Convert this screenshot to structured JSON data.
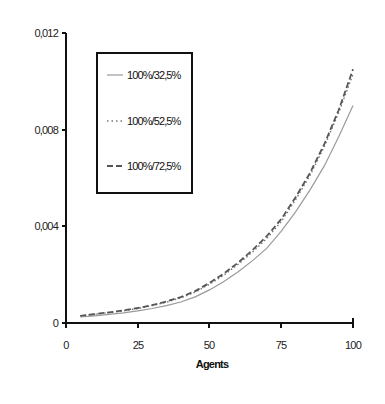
{
  "chart_data": {
    "type": "line",
    "title": "",
    "xlabel": "Agents",
    "ylabel": "",
    "xlim": [
      0,
      100
    ],
    "ylim": [
      0,
      0.012
    ],
    "x_ticks": [
      "0",
      "25",
      "50",
      "75",
      "100"
    ],
    "y_ticks": [
      "0",
      "0,004",
      "0,008",
      "0,012"
    ],
    "grid": false,
    "legend_position": "upper-left-inside",
    "x": [
      5,
      10,
      15,
      20,
      25,
      30,
      35,
      40,
      45,
      50,
      55,
      60,
      65,
      70,
      75,
      80,
      85,
      90,
      95,
      100
    ],
    "series": [
      {
        "name": "100%/32,5%",
        "style": "solid",
        "color": "#9a9a9a",
        "values": [
          0.00025,
          0.0003,
          0.00036,
          0.00042,
          0.0005,
          0.0006,
          0.00072,
          0.00087,
          0.00108,
          0.00137,
          0.00172,
          0.00212,
          0.00258,
          0.0031,
          0.0038,
          0.0046,
          0.0055,
          0.0065,
          0.0077,
          0.009
        ]
      },
      {
        "name": "100%/52,5%",
        "style": "dotted",
        "color": "#777777",
        "values": [
          0.0003,
          0.00036,
          0.00043,
          0.0005,
          0.0006,
          0.00072,
          0.00086,
          0.00104,
          0.00128,
          0.0016,
          0.00198,
          0.00243,
          0.00294,
          0.0035,
          0.0042,
          0.0051,
          0.0061,
          0.0073,
          0.0087,
          0.0103
        ]
      },
      {
        "name": "100%/72,5%",
        "style": "dashed",
        "color": "#555555",
        "values": [
          0.0003,
          0.00037,
          0.00044,
          0.00052,
          0.00062,
          0.00074,
          0.00089,
          0.00107,
          0.00132,
          0.00166,
          0.00205,
          0.0025,
          0.00302,
          0.0036,
          0.0043,
          0.0052,
          0.0062,
          0.0074,
          0.0088,
          0.0105
        ]
      }
    ]
  },
  "legend": {
    "items": [
      {
        "label": "100%/32,5%",
        "style": "solid"
      },
      {
        "label": "100%/52,5%",
        "style": "dotted"
      },
      {
        "label": "100%/72,5%",
        "style": "dashed"
      }
    ]
  },
  "axes": {
    "x_title": "Agents",
    "x_ticks": [
      "0",
      "25",
      "50",
      "75",
      "100"
    ],
    "y_ticks": [
      "0",
      "0,004",
      "0,008",
      "0,012"
    ]
  }
}
